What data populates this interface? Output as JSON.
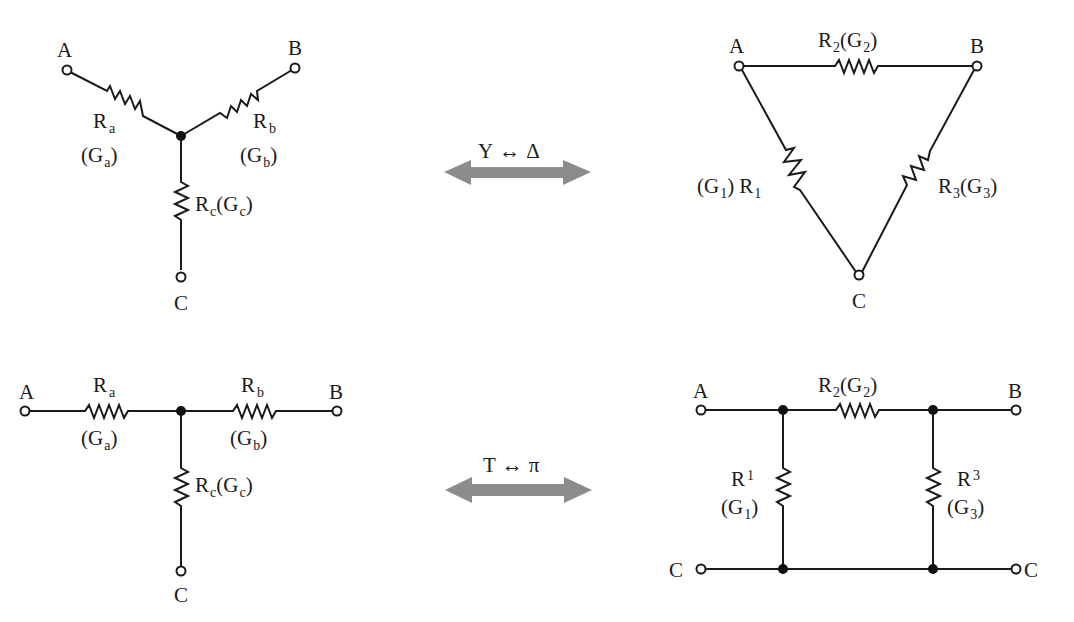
{
  "diagram": {
    "y_network": {
      "terminals": [
        "A",
        "B",
        "C"
      ],
      "resistors": [
        {
          "name": "R",
          "sub": "a",
          "cond": "G",
          "csub": "a"
        },
        {
          "name": "R",
          "sub": "b",
          "cond": "G",
          "csub": "b"
        },
        {
          "name": "R",
          "sub": "c",
          "cond": "G",
          "csub": "c"
        }
      ]
    },
    "delta_network": {
      "terminals": [
        "A",
        "B",
        "C"
      ],
      "resistors": [
        {
          "name": "R",
          "sub": "1",
          "cond": "G",
          "csub": "1"
        },
        {
          "name": "R",
          "sub": "2",
          "cond": "G",
          "csub": "2"
        },
        {
          "name": "R",
          "sub": "3",
          "cond": "G",
          "csub": "3"
        }
      ]
    },
    "t_network": {
      "terminals": [
        "A",
        "B",
        "C"
      ],
      "resistors": [
        {
          "name": "R",
          "sub": "a",
          "cond": "G",
          "csub": "a"
        },
        {
          "name": "R",
          "sub": "b",
          "cond": "G",
          "csub": "b"
        },
        {
          "name": "R",
          "sub": "c",
          "cond": "G",
          "csub": "c"
        }
      ]
    },
    "pi_network": {
      "terminals": [
        "A",
        "B",
        "C",
        "C"
      ],
      "resistors": [
        {
          "name": "R",
          "sub": "1",
          "cond": "G",
          "csub": "1"
        },
        {
          "name": "R",
          "sub": "2",
          "cond": "G",
          "csub": "2"
        },
        {
          "name": "R",
          "sub": "3",
          "cond": "G",
          "csub": "3"
        }
      ]
    },
    "transforms": [
      {
        "label_left": "Y",
        "symbol": "↔",
        "label_right": "Δ"
      },
      {
        "label_left": "T",
        "symbol": "↔",
        "label_right": "π"
      }
    ],
    "colors": {
      "wire": "#1a1a1a",
      "arrow": "#8c8c8c",
      "background": "#ffffff"
    }
  }
}
